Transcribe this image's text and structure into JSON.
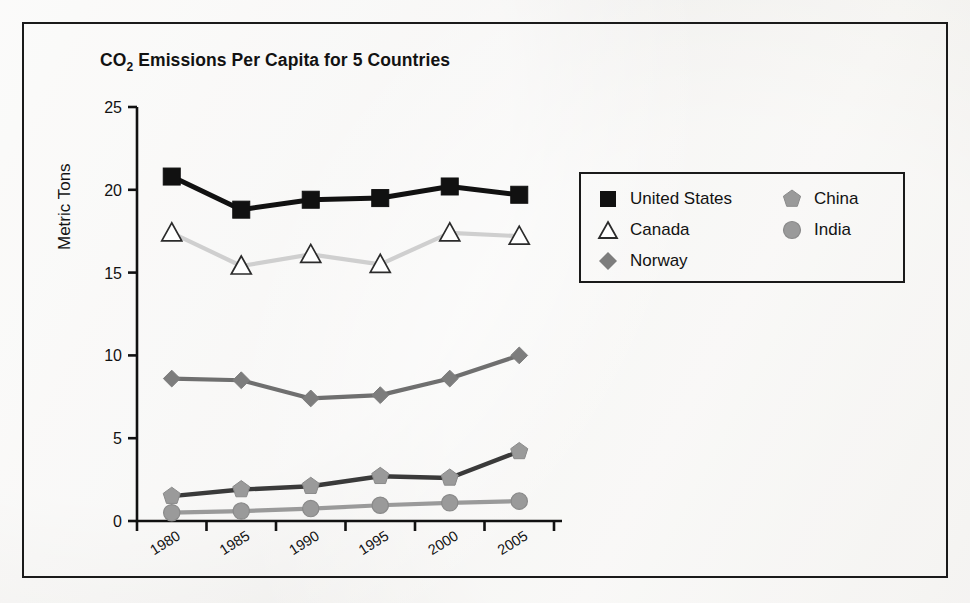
{
  "figure": {
    "title_main": "CO",
    "title_sub": "2",
    "title_rest": " Emissions Per Capita for 5 Countries"
  },
  "chart_data": {
    "type": "line",
    "title": "CO2 Emissions Per Capita for 5 Countries",
    "xlabel": "",
    "ylabel": "Metric Tons",
    "categories": [
      "1980",
      "1985",
      "1990",
      "1995",
      "2000",
      "2005"
    ],
    "ylim": [
      0,
      25
    ],
    "yticks": [
      0,
      5,
      10,
      15,
      20,
      25
    ],
    "grid": false,
    "legend_position": "inside-upper-right",
    "series": [
      {
        "name": "United States",
        "values": [
          20.8,
          18.8,
          19.4,
          19.5,
          20.2,
          19.7
        ],
        "marker": "square",
        "color": "#111111",
        "line_color": "#111111"
      },
      {
        "name": "Canada",
        "values": [
          17.4,
          15.4,
          16.1,
          15.5,
          17.4,
          17.2
        ],
        "marker": "triangle",
        "color": "#ffffff",
        "line_color": "#cfcfcf"
      },
      {
        "name": "Norway",
        "values": [
          8.6,
          8.5,
          7.4,
          7.6,
          8.6,
          10.0
        ],
        "marker": "diamond",
        "color": "#7d7d7d",
        "line_color": "#6f6f6f"
      },
      {
        "name": "China",
        "values": [
          1.5,
          1.9,
          2.1,
          2.7,
          2.6,
          4.2
        ],
        "marker": "pentagon",
        "color": "#9a9a9a",
        "line_color": "#3a3a3a"
      },
      {
        "name": "India",
        "values": [
          0.5,
          0.6,
          0.75,
          0.95,
          1.1,
          1.2
        ],
        "marker": "circle",
        "color": "#9a9a9a",
        "line_color": "#9a9a9a"
      }
    ]
  },
  "legend": {
    "left_column": [
      {
        "label": "United States",
        "marker": "square"
      },
      {
        "label": "Canada",
        "marker": "triangle"
      },
      {
        "label": "Norway",
        "marker": "diamond"
      }
    ],
    "right_column": [
      {
        "label": "China",
        "marker": "pentagon"
      },
      {
        "label": "India",
        "marker": "circle"
      }
    ]
  },
  "colors": {
    "frame": "#1a1a1a",
    "axis": "#111111",
    "us": "#111111",
    "canada_line": "#cfcfcf",
    "norway": "#6f6f6f",
    "china_line": "#3a3a3a",
    "india": "#9a9a9a",
    "background": "#f4f3f1"
  }
}
